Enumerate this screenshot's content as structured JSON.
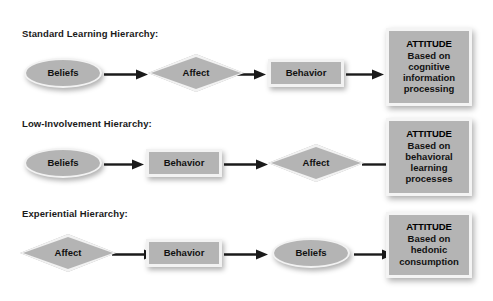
{
  "diagram": {
    "colors": {
      "shape_fill": "#b4b4b4",
      "shape_border": "#f2f2f2",
      "arrow": "#1a1a1a",
      "text": "#111111",
      "background": "#ffffff"
    },
    "rows": [
      {
        "label": "Standard Learning Hierarchy:",
        "nodes": [
          {
            "shape": "ellipse",
            "label": "Beliefs"
          },
          {
            "shape": "diamond",
            "label": "Affect"
          },
          {
            "shape": "rect",
            "label": "Behavior"
          }
        ],
        "outcome": {
          "title": "ATTITUDE",
          "description": "Based on cognitive information processing"
        }
      },
      {
        "label": "Low-Involvement Hierarchy:",
        "nodes": [
          {
            "shape": "ellipse",
            "label": "Beliefs"
          },
          {
            "shape": "rect",
            "label": "Behavior"
          },
          {
            "shape": "diamond",
            "label": "Affect"
          }
        ],
        "outcome": {
          "title": "ATTITUDE",
          "description": "Based on behavioral learning processes"
        }
      },
      {
        "label": "Experiential Hierarchy:",
        "nodes": [
          {
            "shape": "diamond",
            "label": "Affect"
          },
          {
            "shape": "rect",
            "label": "Behavior"
          },
          {
            "shape": "ellipse",
            "label": "Beliefs"
          }
        ],
        "outcome": {
          "title": "ATTITUDE",
          "description": "Based on hedonic consumption"
        }
      }
    ]
  }
}
